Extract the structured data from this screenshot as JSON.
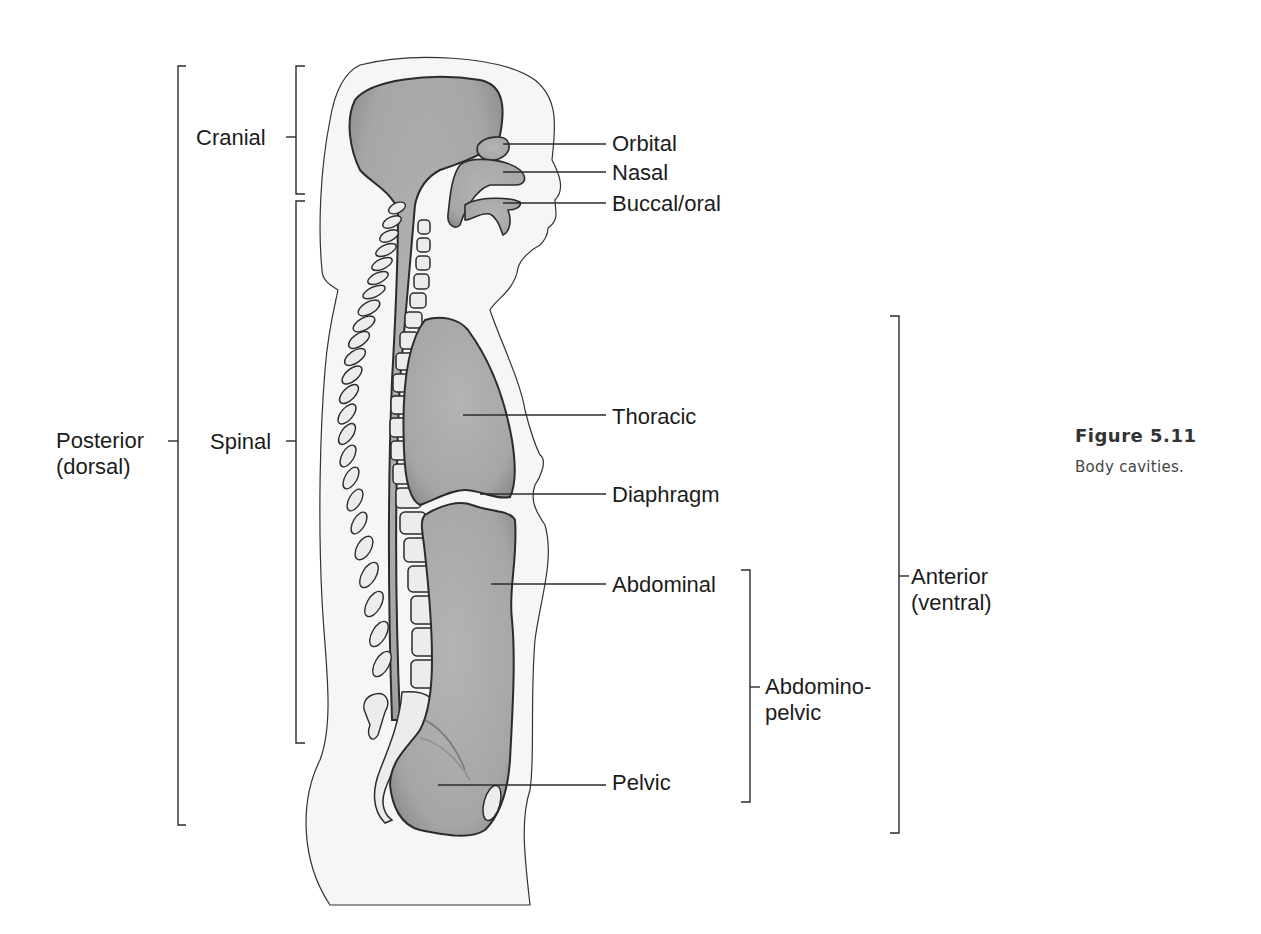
{
  "caption": {
    "title": "Figure 5.11",
    "text": "Body cavities."
  },
  "labels": {
    "posterior": [
      "Posterior",
      "(dorsal)"
    ],
    "cranial": "Cranial",
    "spinal": "Spinal",
    "orbital": "Orbital",
    "nasal": "Nasal",
    "buccal": "Buccal/oral",
    "thoracic": "Thoracic",
    "diaphragm": "Diaphragm",
    "abdominal": "Abdominal",
    "pelvic": "Pelvic",
    "abdominopelvic": [
      "Abdomino-",
      "pelvic"
    ],
    "anterior": [
      "Anterior",
      "(ventral)"
    ]
  },
  "colors": {
    "cavity_fill": "#a9a9a9",
    "body_fill": "#f6f6f6",
    "outline": "#2b2b2b",
    "bone_fill": "#ececec"
  }
}
